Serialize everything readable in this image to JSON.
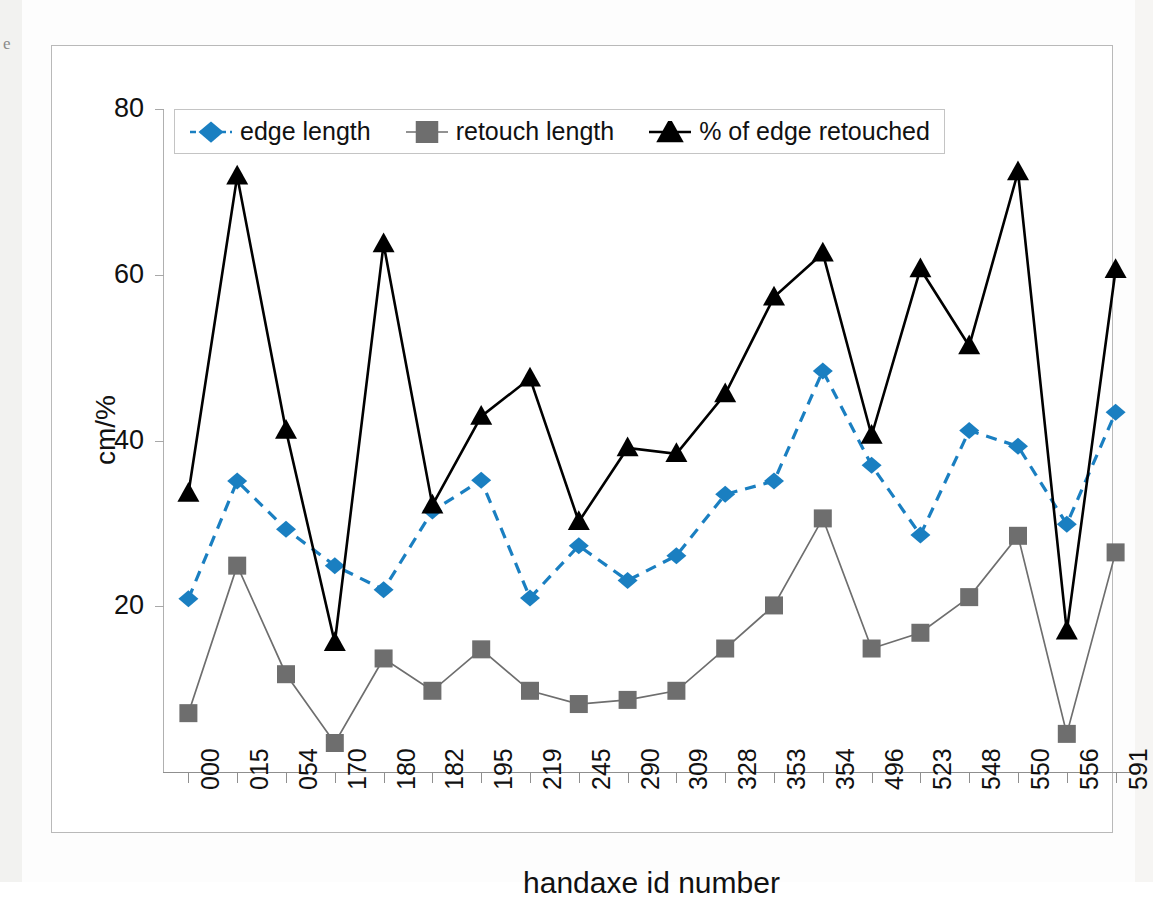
{
  "chart_data": {
    "type": "line",
    "title": "",
    "xlabel": "handaxe id number",
    "ylabel": "cm/%",
    "categories": [
      "000",
      "015",
      "054",
      "170",
      "180",
      "182",
      "195",
      "219",
      "245",
      "290",
      "309",
      "328",
      "353",
      "354",
      "496",
      "523",
      "548",
      "550",
      "556",
      "591"
    ],
    "ylim": [
      0,
      80
    ],
    "yticks": [
      20,
      40,
      60,
      80
    ],
    "grid": false,
    "legend_position": "top-left inside plot",
    "series": [
      {
        "name": "edge length",
        "color": "#1a7fc1",
        "marker": "diamond",
        "line_style": "dashed",
        "values": [
          20.9,
          35.1,
          29.3,
          24.9,
          22.0,
          31.5,
          35.2,
          21.0,
          27.3,
          23.1,
          26.1,
          33.5,
          35.1,
          48.4,
          37.0,
          28.6,
          41.2,
          39.3,
          29.9,
          43.4
        ]
      },
      {
        "name": "retouch length",
        "color": "#6e6e6e",
        "marker": "square",
        "line_style": "solid",
        "values": [
          7.1,
          24.9,
          11.8,
          3.5,
          13.7,
          9.8,
          14.8,
          9.8,
          8.2,
          8.7,
          9.8,
          14.9,
          20.1,
          30.6,
          14.9,
          16.8,
          21.1,
          28.5,
          4.6,
          26.5
        ]
      },
      {
        "name": "% of edge retouched",
        "color": "#000000",
        "marker": "triangle",
        "line_style": "solid",
        "values": [
          33.6,
          71.9,
          41.2,
          15.6,
          63.7,
          32.2,
          42.9,
          47.5,
          30.2,
          39.1,
          38.4,
          45.6,
          57.3,
          62.6,
          40.6,
          60.7,
          51.4,
          72.4,
          17.0,
          60.6
        ]
      }
    ]
  },
  "legend": {
    "items": [
      {
        "label": "edge length"
      },
      {
        "label": "retouch length"
      },
      {
        "label": "% of edge retouched"
      }
    ]
  },
  "axes": {
    "y_title": "cm/%",
    "x_title": "handaxe id number",
    "y_tick_labels": [
      "80",
      "60",
      "40",
      "20"
    ]
  },
  "margin_mark": "e"
}
